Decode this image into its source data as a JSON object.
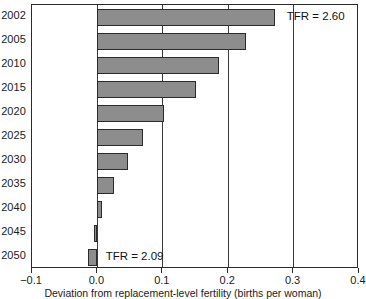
{
  "chart_data": {
    "type": "bar",
    "orientation": "horizontal",
    "title": "",
    "subtitle": "",
    "xlabel": "Deviation from replacement-level fertility (births per woman)",
    "ylabel": "",
    "categories": [
      "2002",
      "2005",
      "2010",
      "2015",
      "2020",
      "2025",
      "2030",
      "2035",
      "2040",
      "2045",
      "2050"
    ],
    "values": [
      0.272,
      0.227,
      0.186,
      0.151,
      0.102,
      0.07,
      0.047,
      0.025,
      0.007,
      -0.005,
      -0.014
    ],
    "xlim": [
      -0.1,
      0.4
    ],
    "ylim": [
      0,
      11
    ],
    "xticks": [
      -0.1,
      0.0,
      0.1,
      0.2,
      0.3,
      0.4
    ],
    "xtick_labels": [
      "−0.1",
      "0.0",
      "0.1",
      "0.2",
      "0.3",
      "0.4"
    ],
    "grid": "vertical",
    "gridlines": [
      0.0,
      0.1,
      0.2,
      0.3
    ],
    "legend": "none",
    "bar_color": "#8d8d8d",
    "bar_edge_color": "#2b2b2b",
    "annotations": [
      {
        "text": "TFR = 2.60",
        "category": "2002",
        "x": 0.285
      },
      {
        "text": "TFR = 2.09",
        "category": "2050",
        "x": 0.008
      }
    ]
  }
}
